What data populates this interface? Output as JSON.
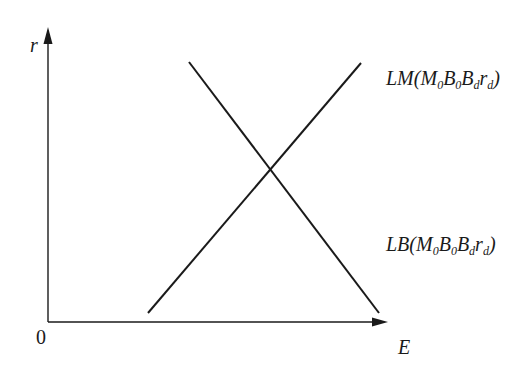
{
  "diagram": {
    "type": "economic-curve-diagram",
    "colors": {
      "background": "#ffffff",
      "ink": "#1a1a1a"
    },
    "axes": {
      "y_label": "r",
      "x_label": "E",
      "origin_label": "0"
    },
    "curves": [
      {
        "id": "LM",
        "name": "LM",
        "prefix": "LM(",
        "params": [
          {
            "base": "M",
            "sub": "0"
          },
          {
            "base": "B",
            "sub": "0"
          },
          {
            "base": "B",
            "sub": "d"
          },
          {
            "base": "r",
            "sub": "d"
          }
        ],
        "suffix": ")",
        "slope": "upward",
        "from": [
          148,
          313
        ],
        "to": [
          361,
          63
        ]
      },
      {
        "id": "LB",
        "name": "LB",
        "prefix": "LB(",
        "params": [
          {
            "base": "M",
            "sub": "0"
          },
          {
            "base": "B",
            "sub": "0"
          },
          {
            "base": "B",
            "sub": "d"
          },
          {
            "base": "r",
            "sub": "d"
          }
        ],
        "suffix": ")",
        "slope": "downward",
        "from": [
          189,
          62
        ],
        "to": [
          379,
          313
        ]
      }
    ]
  }
}
